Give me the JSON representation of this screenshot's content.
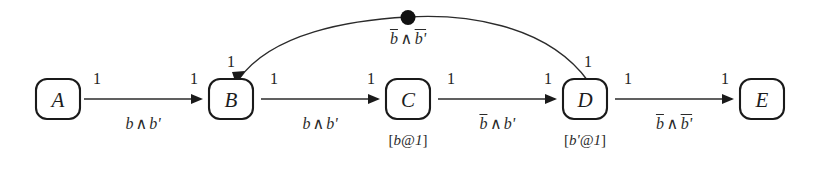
{
  "diagram": {
    "type": "state-transition-automaton",
    "width": 820,
    "height": 172,
    "background_color": "#ffffff",
    "stroke_color": "#1a1a1a",
    "nodes": [
      {
        "id": "A",
        "label": "A",
        "cx": 58,
        "cy": 99,
        "annotation": ""
      },
      {
        "id": "B",
        "label": "B",
        "cx": 231,
        "cy": 99,
        "annotation": ""
      },
      {
        "id": "C",
        "label": "C",
        "cx": 408,
        "cy": 99,
        "annotation": "[b@1]"
      },
      {
        "id": "D",
        "label": "D",
        "cx": 585,
        "cy": 99,
        "annotation": "[b'@1]"
      },
      {
        "id": "E",
        "label": "E",
        "cx": 762,
        "cy": 99,
        "annotation": ""
      }
    ],
    "edges": [
      {
        "id": "A-B",
        "from": "A",
        "to": "B",
        "kind": "straight",
        "guard_plain": "b ^ b'",
        "guard_parts": [
          {
            "text": "b",
            "overline": false
          },
          {
            "text": "∧",
            "operator": true
          },
          {
            "text": "b'",
            "overline": false
          }
        ],
        "source_weight": "1",
        "target_weight": "1"
      },
      {
        "id": "B-C",
        "from": "B",
        "to": "C",
        "kind": "straight",
        "guard_plain": "b ^ b'",
        "guard_parts": [
          {
            "text": "b",
            "overline": false
          },
          {
            "text": "∧",
            "operator": true
          },
          {
            "text": "b'",
            "overline": false
          }
        ],
        "source_weight": "1",
        "target_weight": "1"
      },
      {
        "id": "C-D",
        "from": "C",
        "to": "D",
        "kind": "straight",
        "guard_plain": "!b ^ b'",
        "guard_parts": [
          {
            "text": "b",
            "overline": true
          },
          {
            "text": "∧",
            "operator": true
          },
          {
            "text": "b'",
            "overline": false
          }
        ],
        "source_weight": "1",
        "target_weight": "1"
      },
      {
        "id": "D-E",
        "from": "D",
        "to": "E",
        "kind": "straight",
        "guard_plain": "!b ^ !b'",
        "guard_parts": [
          {
            "text": "b",
            "overline": true
          },
          {
            "text": "∧",
            "operator": true
          },
          {
            "text": "b'",
            "overline": true
          }
        ],
        "source_weight": "1",
        "target_weight": "1"
      },
      {
        "id": "D-B",
        "from": "D",
        "to": "B",
        "kind": "arc",
        "guard_plain": "!b ^ !b'",
        "guard_parts": [
          {
            "text": "b",
            "overline": true
          },
          {
            "text": "∧",
            "operator": true
          },
          {
            "text": "b'",
            "overline": true
          }
        ],
        "source_weight": "1",
        "target_weight": "1",
        "has_junction_dot": true
      }
    ],
    "labels": {
      "weight_a_out": "1",
      "weight_b_in": "1",
      "weight_b_top": "1",
      "weight_b_out": "1",
      "weight_c_in": "1",
      "weight_c_out": "1",
      "weight_d_in": "1",
      "weight_d_top": "1",
      "weight_d_out": "1",
      "weight_e_in": "1",
      "node_a": "A",
      "node_b": "B",
      "node_c": "C",
      "node_d": "D",
      "node_e": "E",
      "annot_c": "[b@1]",
      "annot_d": "[b'@1]"
    }
  }
}
